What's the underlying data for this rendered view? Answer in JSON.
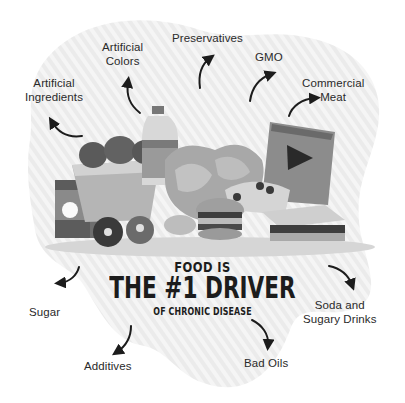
{
  "infographic": {
    "headline": {
      "line1": "FOOD IS",
      "line2": "THE #1 DRIVER",
      "line3": "OF CHRONIC DISEASE"
    },
    "labels": [
      {
        "id": "artificial-ingredients",
        "line1": "Artificial",
        "line2": "Ingredients"
      },
      {
        "id": "artificial-colors",
        "line1": "Artificial",
        "line2": "Colors"
      },
      {
        "id": "preservatives",
        "line1": "Preservatives",
        "line2": ""
      },
      {
        "id": "gmo",
        "line1": "GMO",
        "line2": ""
      },
      {
        "id": "commercial-meat",
        "line1": "Commercial",
        "line2": "Meat"
      },
      {
        "id": "sugar",
        "line1": "Sugar",
        "line2": ""
      },
      {
        "id": "additives",
        "line1": "Additives",
        "line2": ""
      },
      {
        "id": "bad-oils",
        "line1": "Bad Oils",
        "line2": ""
      },
      {
        "id": "soda",
        "line1": "Soda and",
        "line2": "Sugary Drinks"
      }
    ],
    "illustration": {
      "items": [
        "fried-chicken-bucket",
        "soda-bottle",
        "chips",
        "pizza-slice",
        "chip-bag",
        "sandwich",
        "burger",
        "donuts",
        "juice-box"
      ]
    },
    "colors": {
      "blob": "#ececec",
      "stripe": "#f6f6f6",
      "ink": "#1c1c1c"
    }
  }
}
